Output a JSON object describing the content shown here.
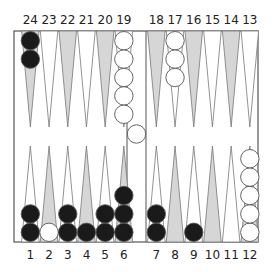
{
  "diagram": {
    "colors": {
      "board_bg": "#ffffff",
      "frame": "#555555",
      "point_dark": "#d6d6d6",
      "point_light": "#ffffff",
      "point_stroke": "#777777",
      "black_checker": "#1a1a1a",
      "white_checker": "#ffffff",
      "checker_stroke": "#555555"
    },
    "top_labels": [
      "24",
      "23",
      "22",
      "21",
      "20",
      "19",
      "18",
      "17",
      "16",
      "15",
      "14",
      "13"
    ],
    "bottom_labels": [
      "1",
      "2",
      "3",
      "4",
      "5",
      "6",
      "7",
      "8",
      "9",
      "10",
      "11",
      "12"
    ],
    "points": [
      {
        "point": 1,
        "color": "black",
        "count": 2
      },
      {
        "point": 2,
        "color": "white",
        "count": 1
      },
      {
        "point": 3,
        "color": "black",
        "count": 2
      },
      {
        "point": 4,
        "color": "black",
        "count": 1
      },
      {
        "point": 5,
        "color": "black",
        "count": 2
      },
      {
        "point": 6,
        "color": "black",
        "count": 3
      },
      {
        "point": 7,
        "color": "black",
        "count": 2
      },
      {
        "point": 8,
        "color": null,
        "count": 0
      },
      {
        "point": 9,
        "color": "black",
        "count": 1
      },
      {
        "point": 10,
        "color": null,
        "count": 0
      },
      {
        "point": 11,
        "color": null,
        "count": 0
      },
      {
        "point": 12,
        "color": "white",
        "count": 5
      },
      {
        "point": 13,
        "color": null,
        "count": 0
      },
      {
        "point": 14,
        "color": null,
        "count": 0
      },
      {
        "point": 15,
        "color": null,
        "count": 0
      },
      {
        "point": 16,
        "color": null,
        "count": 0
      },
      {
        "point": 17,
        "color": "white",
        "count": 3
      },
      {
        "point": 18,
        "color": null,
        "count": 0
      },
      {
        "point": 19,
        "color": "white",
        "count": 5
      },
      {
        "point": 20,
        "color": null,
        "count": 0
      },
      {
        "point": 21,
        "color": null,
        "count": 0
      },
      {
        "point": 22,
        "color": null,
        "count": 0
      },
      {
        "point": 23,
        "color": null,
        "count": 0
      },
      {
        "point": 24,
        "color": "black",
        "count": 2
      }
    ],
    "bar": [
      {
        "color": "white",
        "count": 1
      }
    ]
  }
}
